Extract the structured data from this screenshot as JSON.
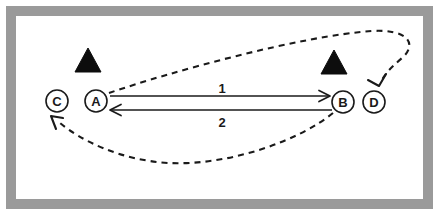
{
  "figure": {
    "canvas": {
      "width": 439,
      "height": 215
    },
    "background_color": "#ffffff",
    "ink_color": "#1a1a1a"
  },
  "frame": {
    "name": "outer-frame",
    "border_color": "#9a9a9a",
    "border_thickness": 10,
    "outer_margin": 6,
    "interior_color": "#ffffff"
  },
  "nodes": [
    {
      "id": "C",
      "label": "C",
      "cx": 57,
      "cy": 101,
      "r": 11
    },
    {
      "id": "A",
      "label": "A",
      "cx": 96,
      "cy": 101,
      "r": 11
    },
    {
      "id": "B",
      "label": "B",
      "cx": 343,
      "cy": 102,
      "r": 11
    },
    {
      "id": "D",
      "label": "D",
      "cx": 374,
      "cy": 102,
      "r": 11
    }
  ],
  "obstacles": [
    {
      "id": "triangle-left",
      "shape": "filled-triangle",
      "cx": 88,
      "cy": 60,
      "half_width": 13,
      "height": 24
    },
    {
      "id": "triangle-right",
      "shape": "filled-triangle",
      "cx": 334,
      "cy": 62,
      "half_width": 13,
      "height": 24
    }
  ],
  "solid_edges": [
    {
      "id": "edge-1",
      "label": "1",
      "from": "A",
      "to": "B",
      "direction": "right",
      "y": 96,
      "x_start": 110,
      "x_end": 330,
      "label_x": 222,
      "label_y": 88
    },
    {
      "id": "edge-2",
      "label": "2",
      "from": "B",
      "to": "A",
      "direction": "left",
      "y": 110,
      "x_start": 332,
      "x_end": 110,
      "label_x": 222,
      "label_y": 122
    }
  ],
  "dashed_edges": [
    {
      "id": "dashed-edge-upper",
      "from": "A",
      "to": "D",
      "style": "dashed",
      "description": "curve from A sweeping up and right, looping around to arrow into D",
      "path": "M 109 93 C 170 72, 300 36, 372 31 C 408 29, 418 44, 402 58 C 394 65, 386 72, 382 80",
      "arrow_tip_x": 379,
      "arrow_tip_y": 85,
      "arrow_head": "M 386 74 L 379 86 L 368 80"
    },
    {
      "id": "dashed-edge-lower",
      "from": "B",
      "to": "C",
      "style": "dashed",
      "description": "curve from B sweeping down and left, arrow into C",
      "path": "M 333 113 C 300 140, 230 166, 168 163 C 120 160, 80 140, 60 123",
      "arrow_tip_x": 52,
      "arrow_tip_y": 117,
      "arrow_head": "M 63 118 L 51 116 L 56 129"
    }
  ]
}
